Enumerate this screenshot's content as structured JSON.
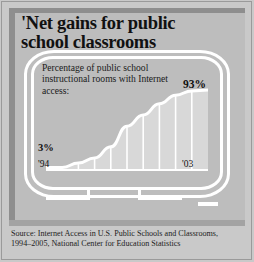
{
  "headline": "'Net gains for public\nschool classrooms",
  "subtitle": "Percentage of public school instructional rooms with Internet access:",
  "labels": {
    "end_value": "93%",
    "start_value": "3%",
    "start_year": "'94",
    "end_year": "'03"
  },
  "source": {
    "line1": "Source: Internet Access in U.S. Public Schools and Classrooms,",
    "line2": "1994–2005, National Center for Education Statistics"
  },
  "colors": {
    "page_background": "#c9c9c9",
    "panel_background": "#bdbdbd",
    "dark_band": "#8e8e8e",
    "source_band": "#a3a3a3",
    "bar_fill": "#d8d8d8",
    "line_and_frame": "#ffffff",
    "text": "#111111"
  },
  "chart_data": {
    "type": "area",
    "title": "Percentage of public school instructional rooms with Internet access",
    "xlabel": "",
    "ylabel": "",
    "categories": [
      "'94",
      "'95",
      "'96",
      "'97",
      "'98",
      "'99",
      "'00",
      "'01",
      "'02",
      "'03"
    ],
    "values": [
      3,
      8,
      14,
      27,
      51,
      64,
      77,
      87,
      92,
      93
    ],
    "ylim": [
      0,
      100
    ],
    "xlim_labels": [
      "'94",
      "'03"
    ],
    "grid": false,
    "legend": null,
    "annotations": [
      {
        "text": "3%",
        "at_category": "'94",
        "value": 3
      },
      {
        "text": "93%",
        "at_category": "'03",
        "value": 93
      }
    ]
  }
}
